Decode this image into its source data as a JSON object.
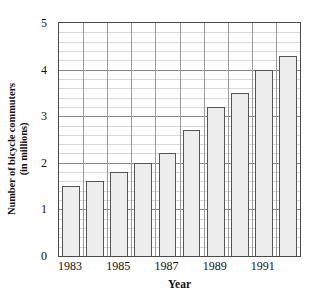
{
  "chart_data": {
    "type": "bar",
    "title": "",
    "xlabel": "Year",
    "ylabel": "Number of bicycle commuters (in millions)",
    "ylabel_lines": [
      "Number of bicycle commuters",
      "(in millions)"
    ],
    "categories": [
      "1983",
      "1984",
      "1985",
      "1986",
      "1987",
      "1988",
      "1989",
      "1990",
      "1991",
      "1992"
    ],
    "values": [
      1.5,
      1.6,
      1.8,
      2.0,
      2.2,
      2.7,
      3.2,
      3.5,
      4.0,
      4.3
    ],
    "ylim": [
      0,
      5
    ],
    "xlim_categories": 10,
    "y_ticks": [
      "0",
      "1",
      "2",
      "3",
      "4",
      "5"
    ],
    "y_tick_values": [
      0,
      1,
      2,
      3,
      4,
      5
    ],
    "y_minor_step": 0.2,
    "x_ticks_visible": [
      "1983",
      "1985",
      "1987",
      "1989",
      "1991"
    ],
    "x_tick_indices": [
      0,
      2,
      4,
      6,
      8
    ],
    "grid": true,
    "grid_minor": true,
    "legend": null,
    "legend_position": "none",
    "colors": {
      "bar_fill": "#ededed",
      "bar_border": "#555555",
      "grid_major": "#8a8a8a",
      "grid_minor": "#d8d8d8",
      "grid_vertical": "#9a9a9a",
      "axis": "#4a4a4a",
      "text": "#111111",
      "background": "#ffffff"
    }
  }
}
